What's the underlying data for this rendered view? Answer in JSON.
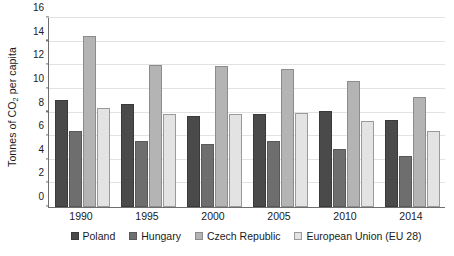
{
  "chart_data": {
    "type": "bar",
    "title": "",
    "subtitle": "",
    "xlabel": "",
    "ylabel": "Tonnes of CO2 per capita",
    "ylabel_prefix": "Tonnes of CO",
    "ylabel_sub": "2",
    "ylabel_suffix": " per capita",
    "categories": [
      "1990",
      "1995",
      "2000",
      "2005",
      "2010",
      "2014"
    ],
    "series": [
      {
        "name": "Poland",
        "color": "#4a4a4a",
        "values": [
          9.1,
          8.7,
          7.7,
          7.9,
          8.1,
          7.4
        ]
      },
      {
        "name": "Hungary",
        "color": "#6e6e6e",
        "values": [
          6.4,
          5.6,
          5.3,
          5.6,
          4.9,
          4.3
        ]
      },
      {
        "name": "Czech Republic",
        "color": "#b4b4b4",
        "values": [
          14.5,
          12.0,
          11.9,
          11.7,
          10.7,
          9.3
        ]
      },
      {
        "name": "European Union (EU 28)",
        "color": "#e3e3e3",
        "values": [
          8.4,
          7.9,
          7.9,
          8.0,
          7.3,
          6.4
        ]
      }
    ],
    "ylim": [
      0,
      16
    ],
    "yticks": [
      0,
      2,
      4,
      6,
      8,
      10,
      12,
      14,
      16
    ],
    "ytick_labels": [
      "0",
      "2",
      "4",
      "6",
      "8",
      "10",
      "12",
      "14",
      "16"
    ],
    "grid": "horizontal",
    "legend_position": "bottom"
  }
}
